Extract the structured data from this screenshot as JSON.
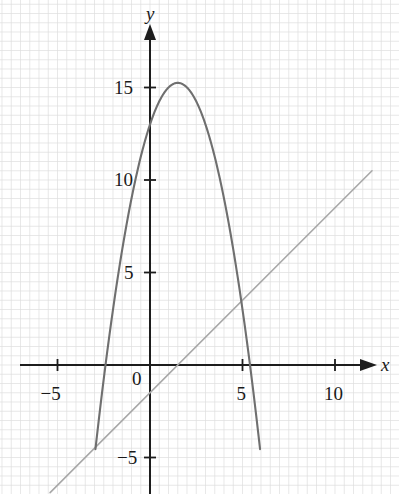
{
  "figure": {
    "width": 399,
    "height": 494,
    "background": "#ffffff"
  },
  "axes": {
    "x_axis_label": "x",
    "y_axis_label": "y",
    "origin_label": "0",
    "x_ticks": [
      {
        "value": -5,
        "label": "−5"
      },
      {
        "value": 5,
        "label": "5"
      },
      {
        "value": 10,
        "label": "10"
      }
    ],
    "y_ticks": [
      {
        "value": 5,
        "label": "5"
      },
      {
        "value": 10,
        "label": "10"
      },
      {
        "value": 15,
        "label": "15"
      },
      {
        "value": -5,
        "label": "−5"
      }
    ],
    "axis_color": "#1d1d1d",
    "grid_color": "#dedede",
    "grid_on": true,
    "grid_step": 1
  },
  "chart_data": {
    "type": "line",
    "title": "",
    "xlabel": "x",
    "ylabel": "y",
    "xlim": [
      -7.3,
      12.6
    ],
    "ylim": [
      -7.0,
      18.5
    ],
    "grid": true,
    "legend": "none",
    "pixel_origin": {
      "x": 150,
      "y": 365
    },
    "pixels_per_unit": 18.5,
    "series": [
      {
        "name": "parabola",
        "kind": "quadratic",
        "color": "#6f6f6f",
        "equation": "y = -x^2 + 3x + 13",
        "a": -1.0,
        "b": 3.0,
        "c": 13.0,
        "vertex": [
          1.5,
          15.25
        ],
        "roots": [
          -2.4,
          5.4
        ],
        "y_intercept": 13.0,
        "x_domain": [
          -2.95,
          5.95
        ],
        "points": [
          [
            -2.95,
            -4.55
          ],
          [
            -2.7,
            -2.39
          ],
          [
            -2.4,
            -0.96
          ],
          [
            -2.0,
            3.0
          ],
          [
            -1.5,
            6.25
          ],
          [
            -1.0,
            9.0
          ],
          [
            -0.5,
            11.25
          ],
          [
            0.0,
            13.0
          ],
          [
            0.5,
            14.25
          ],
          [
            1.0,
            15.0
          ],
          [
            1.5,
            15.25
          ],
          [
            2.0,
            15.0
          ],
          [
            2.5,
            14.25
          ],
          [
            3.0,
            13.0
          ],
          [
            3.5,
            11.25
          ],
          [
            4.0,
            9.0
          ],
          [
            4.5,
            6.25
          ],
          [
            5.0,
            3.0
          ],
          [
            5.4,
            -0.96
          ],
          [
            5.7,
            -2.39
          ],
          [
            5.95,
            -4.55
          ]
        ]
      },
      {
        "name": "straight-line",
        "kind": "linear",
        "color": "#a8a8a8",
        "equation": "y = x - 1.5",
        "slope": 1.0,
        "intercept": -1.5,
        "x_intercept": 1.5,
        "y_intercept": -1.5,
        "x_domain": [
          -5.4,
          12.0
        ],
        "points": [
          [
            -5.4,
            -6.9
          ],
          [
            12.0,
            10.5
          ]
        ]
      }
    ]
  }
}
